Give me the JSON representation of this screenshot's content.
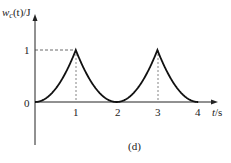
{
  "chart_data": {
    "type": "line",
    "title": "",
    "caption": "(d)",
    "ylabel": "w_c(t)/J",
    "xlabel": "t/s",
    "x_ticks": [
      "1",
      "2",
      "3",
      "4"
    ],
    "y_ticks": [
      "1"
    ],
    "origin_label": "0",
    "xlim": [
      0,
      4.3
    ],
    "ylim": [
      0,
      1.5
    ],
    "grid": false,
    "series": [
      {
        "name": "w_c(t)",
        "x": [
          0,
          0.25,
          0.5,
          0.75,
          1,
          1.25,
          1.5,
          1.75,
          2,
          2.25,
          2.5,
          2.75,
          3,
          3.25,
          3.5,
          3.75,
          4
        ],
        "values": [
          0,
          0.0625,
          0.25,
          0.5625,
          1,
          0.5625,
          0.25,
          0.0625,
          0,
          0.0625,
          0.25,
          0.5625,
          1,
          0.5625,
          0.25,
          0.0625,
          0
        ]
      }
    ],
    "annotations": [
      "dashed guide from y=1 to peak at t=1",
      "dashed vertical lines at t=1 and t=3"
    ]
  },
  "labels": {
    "y_axis": "w",
    "y_axis_sub": "c",
    "y_axis_rest": "(t)/J",
    "x_axis_t": "t",
    "x_axis_unit": "/s",
    "origin": "0",
    "y_one": "1",
    "tick1": "1",
    "tick2": "2",
    "tick3": "3",
    "tick4": "4",
    "caption": "(d)"
  }
}
